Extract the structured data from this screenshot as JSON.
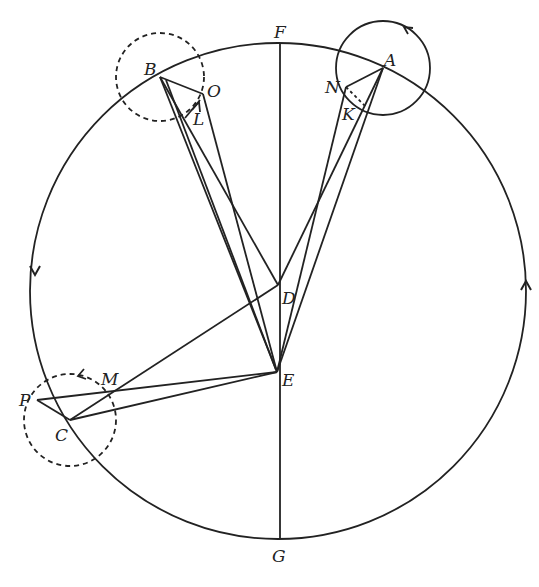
{
  "figure": {
    "type": "epicycle geometry diagram",
    "stroke_color": "#222222",
    "background": "#ffffff"
  },
  "main_circle": {
    "cx": 278,
    "cy": 291,
    "r": 248,
    "arrow_left_direction": "down",
    "arrow_right_direction": "up"
  },
  "points": {
    "A": {
      "label": "A",
      "x": 383,
      "y": 68
    },
    "B": {
      "label": "B",
      "x": 160,
      "y": 77
    },
    "C": {
      "label": "C",
      "x": 70,
      "y": 420
    },
    "D": {
      "label": "D",
      "x": 278,
      "y": 285
    },
    "E": {
      "label": "E",
      "x": 277,
      "y": 372
    },
    "F": {
      "label": "F",
      "x": 280,
      "y": 44
    },
    "G": {
      "label": "G",
      "x": 280,
      "y": 538
    },
    "K": {
      "label": "K",
      "x": 367,
      "y": 108
    },
    "L": {
      "label": "L",
      "x": 197,
      "y": 113
    },
    "M": {
      "label": "M",
      "x": 110,
      "y": 391
    },
    "N": {
      "label": "N",
      "x": 346,
      "y": 87
    },
    "O": {
      "label": "O",
      "x": 200,
      "y": 93
    },
    "P": {
      "label": "P",
      "x": 37,
      "y": 400
    }
  },
  "epicycles": [
    {
      "center": "A",
      "r": 47,
      "style": "solid"
    },
    {
      "center": "B",
      "r": 44,
      "style": "dashed"
    },
    {
      "center": "C",
      "r": 46,
      "style": "dashed"
    }
  ],
  "labels": [
    {
      "text": "F",
      "x": 274,
      "y": 38
    },
    {
      "text": "A",
      "x": 384,
      "y": 66
    },
    {
      "text": "B",
      "x": 144,
      "y": 75
    },
    {
      "text": "O",
      "x": 207,
      "y": 97
    },
    {
      "text": "L",
      "x": 193,
      "y": 125
    },
    {
      "text": "N",
      "x": 325,
      "y": 93
    },
    {
      "text": "K",
      "x": 342,
      "y": 120
    },
    {
      "text": "D",
      "x": 282,
      "y": 304
    },
    {
      "text": "E",
      "x": 282,
      "y": 386
    },
    {
      "text": "M",
      "x": 101,
      "y": 385
    },
    {
      "text": "P",
      "x": 19,
      "y": 406
    },
    {
      "text": "C",
      "x": 55,
      "y": 441
    },
    {
      "text": "G",
      "x": 272,
      "y": 562
    }
  ]
}
